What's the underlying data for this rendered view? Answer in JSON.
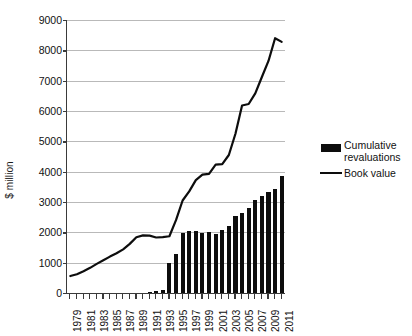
{
  "chart_data": {
    "type": "bar",
    "title": "",
    "subtitle": "",
    "xlabel": "",
    "ylabel": "$ million",
    "ylim": [
      0,
      9000
    ],
    "ytick_step": 1000,
    "yticks": [
      0,
      1000,
      2000,
      3000,
      4000,
      5000,
      6000,
      7000,
      8000,
      9000
    ],
    "ytick_labels": [
      "0",
      "1000",
      "2000",
      "3000",
      "4000",
      "5000",
      "6000",
      "7000",
      "8000",
      "9000"
    ],
    "grid": true,
    "legend_position": "right",
    "x": [
      1979,
      1980,
      1981,
      1982,
      1983,
      1984,
      1985,
      1986,
      1987,
      1988,
      1989,
      1990,
      1991,
      1992,
      1993,
      1994,
      1995,
      1996,
      1997,
      1998,
      1999,
      2000,
      2001,
      2002,
      2003,
      2004,
      2005,
      2006,
      2007,
      2008,
      2009,
      2010,
      2011
    ],
    "xtick_labels": [
      "1979",
      "1981",
      "1983",
      "1985",
      "1987",
      "1989",
      "1991",
      "1993",
      "1995",
      "1997",
      "1999",
      "2001",
      "2003",
      "2005",
      "2007",
      "2009",
      "2011"
    ],
    "xtick_label_years": [
      1979,
      1981,
      1983,
      1985,
      1987,
      1989,
      1991,
      1993,
      1995,
      1997,
      1999,
      2001,
      2003,
      2005,
      2007,
      2009,
      2011
    ],
    "series": [
      {
        "name": "Cumulative revaluations",
        "render": "bar",
        "color": "#0d0d0d",
        "values": [
          0,
          0,
          0,
          0,
          0,
          0,
          0,
          0,
          0,
          0,
          0,
          0,
          30,
          50,
          90,
          1000,
          1280,
          1980,
          2060,
          2040,
          1990,
          2000,
          1950,
          2090,
          2200,
          2540,
          2650,
          2800,
          3080,
          3190,
          3340,
          3420,
          3850
        ]
      },
      {
        "name": "Book value",
        "render": "line",
        "color": "#0d0d0d",
        "values": [
          560,
          620,
          720,
          830,
          960,
          1080,
          1200,
          1310,
          1440,
          1620,
          1840,
          1900,
          1890,
          1830,
          1840,
          1870,
          2400,
          3050,
          3350,
          3720,
          3900,
          3930,
          4230,
          4250,
          4550,
          5250,
          6180,
          6230,
          6580,
          7120,
          7650,
          8400,
          8280
        ]
      }
    ],
    "legend": [
      {
        "label_lines": [
          "Cumulative",
          "revaluations"
        ],
        "marker": "bar-swatch",
        "color": "#0d0d0d"
      },
      {
        "label_lines": [
          "Book value"
        ],
        "marker": "line-swatch",
        "color": "#0d0d0d"
      }
    ]
  },
  "axis": {
    "y_title": "$ million"
  },
  "legend_items": [
    {
      "line1": "Cumulative",
      "line2": "revaluations"
    },
    {
      "line1": "Book value",
      "line2": ""
    }
  ]
}
